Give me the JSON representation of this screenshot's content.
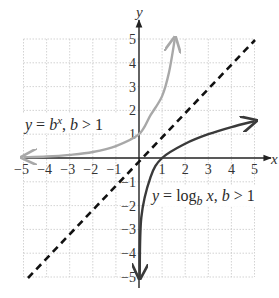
{
  "chart_data": {
    "type": "line",
    "title": "",
    "xlabel": "x",
    "ylabel": "y",
    "xlim": [
      -5,
      5
    ],
    "ylim": [
      -5,
      5
    ],
    "grid": true,
    "x_ticks": [
      "-5",
      "-4",
      "-3",
      "-2",
      "-1",
      "1",
      "2",
      "3",
      "4",
      "5"
    ],
    "y_ticks": [
      "5",
      "4",
      "3",
      "2",
      "1",
      "-1",
      "-2",
      "-3",
      "-4",
      "-5"
    ],
    "series": [
      {
        "name": "y = b^x, b > 1",
        "style": "solid light gray, arrows both ends",
        "color": "#a8a8a8",
        "points": [
          [
            -5,
            0.03
          ],
          [
            -4,
            0.06
          ],
          [
            -3,
            0.13
          ],
          [
            -2,
            0.25
          ],
          [
            -1,
            0.5
          ],
          [
            0,
            1
          ],
          [
            0.5,
            1.8
          ],
          [
            1,
            2.6
          ],
          [
            1.3,
            3.6
          ],
          [
            1.55,
            5
          ]
        ]
      },
      {
        "name": "y = log_b x, b > 1",
        "style": "solid dark gray, arrows both ends",
        "color": "#3a3a3a",
        "points": [
          [
            0.03,
            -5
          ],
          [
            0.1,
            -2.5
          ],
          [
            0.5,
            -0.8
          ],
          [
            1,
            0
          ],
          [
            2,
            0.6
          ],
          [
            3,
            1
          ],
          [
            4,
            1.3
          ],
          [
            5,
            1.55
          ]
        ]
      },
      {
        "name": "y = x",
        "style": "dashed black",
        "color": "#111111",
        "points": [
          [
            -5,
            -5
          ],
          [
            5,
            5
          ]
        ]
      }
    ],
    "annotations": [
      {
        "text": "y = b^x, b > 1",
        "position": [
          -5,
          1.6
        ]
      },
      {
        "text": "y = log_b x, b > 1",
        "position": [
          1,
          -1.5
        ]
      }
    ],
    "legend": "none"
  },
  "labels": {
    "axis_x": "x",
    "axis_y": "y",
    "exp_label": {
      "y": "y",
      "eq": " = ",
      "b": "b",
      "sup": "x",
      "rest1": ", ",
      "b2": "b",
      "rest2": " > 1"
    },
    "log_label": {
      "y": "y",
      "eq": " = log",
      "sub": "b",
      "x": " x",
      "rest1": ", ",
      "b2": "b",
      "rest2": " > 1"
    }
  }
}
